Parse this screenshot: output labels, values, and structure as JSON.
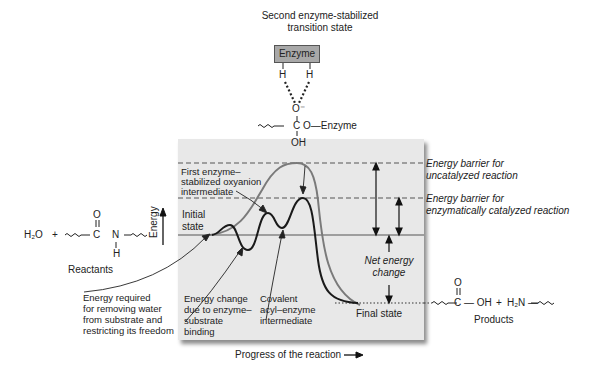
{
  "top": {
    "title_line1": "Second enzyme-stabilized",
    "title_line2": "transition state",
    "enzyme_box_label": "Enzyme",
    "h_left": "H",
    "h_right": "H",
    "o_minus": "O⁻",
    "carbon_chain": "C",
    "o_enzyme": "O—Enzyme",
    "oh": "OH"
  },
  "reactants": {
    "water": "H₂O",
    "plus": "+",
    "carbonyl_o": "O",
    "c": "C",
    "n": "N",
    "h": "H",
    "label": "Reactants"
  },
  "products": {
    "carbonyl_o": "O",
    "c_oh": "C — OH",
    "plus": "+",
    "amine": "H₂N —",
    "label": "Products"
  },
  "axes": {
    "y_label": "Energy",
    "x_label": "Progress of the reaction"
  },
  "panel_labels": {
    "initial_state_1": "Initial",
    "initial_state_2": "state",
    "first_intermediate_1": "First enzyme–",
    "first_intermediate_2": "stabilized oxyanion",
    "first_intermediate_3": "intermediate",
    "binding_1": "Energy change",
    "binding_2": "due to enzyme–",
    "binding_3": "substrate",
    "binding_4": "binding",
    "covalent_1": "Covalent",
    "covalent_2": "acyl–enzyme",
    "covalent_3": "intermediate",
    "net_1": "Net energy",
    "net_2": "change",
    "final_state": "Final state"
  },
  "side_labels": {
    "uncat_1": "Energy barrier for",
    "uncat_2": "uncatalyzed reaction",
    "cat_1": "Energy barrier for",
    "cat_2": "enzymatically catalyzed reaction"
  },
  "left_note": {
    "line1": "Energy required",
    "line2": "for removing water",
    "line3": "from substrate and",
    "line4": "restricting its freedom"
  },
  "colors": {
    "panel_bg": "#e8e8e8",
    "uncatalyzed_curve": "#7a7a7a",
    "catalyzed_curve": "#1a1a1a",
    "enzyme_box": "#a8a8a8"
  }
}
